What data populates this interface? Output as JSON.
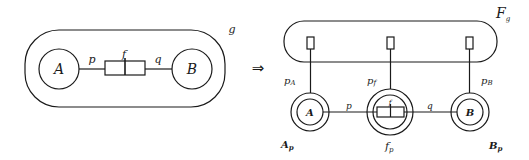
{
  "left": {
    "container_label": "g",
    "node_a": "A",
    "node_b": "B",
    "connector_label": "f",
    "edge_left": "p",
    "edge_right": "q"
  },
  "transform_arrow": "⇒",
  "right": {
    "container_label_main": "F",
    "container_label_sub": "g",
    "ports": [
      {
        "main": "p",
        "sub": "A"
      },
      {
        "main": "p",
        "sub": "f"
      },
      {
        "main": "p",
        "sub": "B"
      }
    ],
    "node_a": {
      "inner": "A",
      "label_main": "A",
      "label_sub": "p"
    },
    "node_f": {
      "inner": "f",
      "label_main": "f",
      "label_sub": "p"
    },
    "node_b": {
      "inner": "B",
      "label_main": "B",
      "label_sub": "p"
    },
    "edge_left": "p",
    "edge_right": "q"
  },
  "colors": {
    "stroke": "#1a1a1a",
    "background": "#ffffff"
  }
}
